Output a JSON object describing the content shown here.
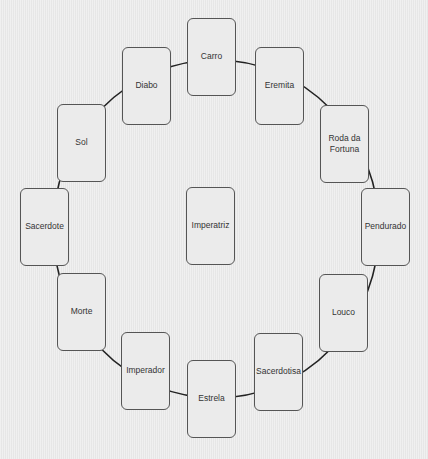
{
  "diagram": {
    "type": "circular-arrangement",
    "ring": {
      "cx": 216,
      "cy": 229,
      "rx": 163,
      "ry": 169,
      "stroke": "#222222"
    },
    "center_card": {
      "label": "Imperatriz",
      "x": 186,
      "y": 187
    },
    "cards": [
      {
        "label": "Carro",
        "x": 187,
        "y": 18
      },
      {
        "label": "Eremita",
        "x": 255,
        "y": 47
      },
      {
        "label": "Roda da Fortuna",
        "x": 320,
        "y": 105
      },
      {
        "label": "Pendurado",
        "x": 361,
        "y": 188
      },
      {
        "label": "Louco",
        "x": 319,
        "y": 274
      },
      {
        "label": "Sacerdotisa",
        "x": 254,
        "y": 333
      },
      {
        "label": "Estrela",
        "x": 187,
        "y": 360
      },
      {
        "label": "Imperador",
        "x": 121,
        "y": 332
      },
      {
        "label": "Morte",
        "x": 57,
        "y": 273
      },
      {
        "label": "Sacerdote",
        "x": 20,
        "y": 188
      },
      {
        "label": "Sol",
        "x": 57,
        "y": 104
      },
      {
        "label": "Diabo",
        "x": 122,
        "y": 47
      }
    ]
  }
}
